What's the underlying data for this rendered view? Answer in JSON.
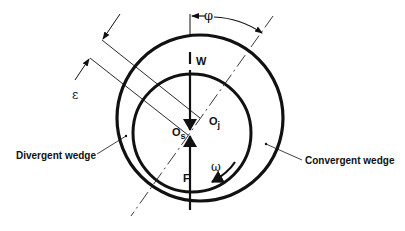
{
  "figure": {
    "labels": {
      "load": "W",
      "force": "F",
      "shaft_center": "O",
      "shaft_center_sub": "s",
      "journal_center": "O",
      "journal_center_sub": "j",
      "attitude_angle": "φ",
      "eccentricity": "ε",
      "rotation": "ω",
      "divergent": "Divergent wedge",
      "convergent": "Convergent wedge"
    },
    "colors": {
      "stroke": "#111111",
      "background": "#ffffff"
    }
  }
}
